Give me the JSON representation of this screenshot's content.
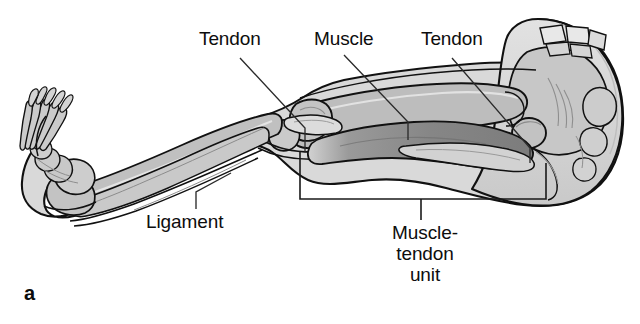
{
  "figure": {
    "panel_letter": "a",
    "background_color": "#ffffff",
    "outline_color": "#111111"
  },
  "palette": {
    "soft_tissue_light": "#d9d9d9",
    "soft_tissue_mid": "#c6c6c6",
    "bone_gray": "#b5b5b5",
    "bone_light": "#cfcfcf",
    "muscle_dark": "#8a8a8a",
    "muscle_darker": "#7b7b7b",
    "outline": "#111111",
    "leader_line": "#2b2b2b",
    "bracket": "#1a1a1a",
    "text": "#0d0d0d"
  },
  "labels": {
    "tendon_proximal": "Tendon",
    "muscle": "Muscle",
    "tendon_distal": "Tendon",
    "ligament": "Ligament",
    "muscle_tendon_unit_line1": "Muscle-",
    "muscle_tendon_unit_line2": "tendon",
    "muscle_tendon_unit_line3": "unit"
  },
  "annotations": {
    "leader_tendon_proximal": {
      "from": [
        240,
        58
      ],
      "bend": [
        305,
        128
      ],
      "to": [
        305,
        152
      ]
    },
    "leader_muscle": {
      "from": [
        344,
        55
      ],
      "bend": [
        408,
        122
      ],
      "to": [
        408,
        140
      ]
    },
    "leader_tendon_distal": {
      "from": [
        452,
        58
      ],
      "bend": [
        530,
        148
      ],
      "to": [
        530,
        163
      ]
    },
    "leader_ligament": {
      "from": [
        231,
        173
      ],
      "bend": [
        196,
        192
      ],
      "to": [
        196,
        209
      ]
    },
    "bracket_muscle_tendon_unit": {
      "left_x": 300,
      "right_x": 546,
      "top_y": 152,
      "bottom_y": 199,
      "stem_x": 421,
      "stem_bottom_y": 220
    }
  },
  "anatomy_parts": [
    {
      "name": "foot",
      "description": "foot with tarsals, metatarsals and phalanges"
    },
    {
      "name": "calcaneus",
      "description": "heel bone"
    },
    {
      "name": "tibia",
      "description": "shin bone of lower leg"
    },
    {
      "name": "fibula",
      "description": "lateral bone of lower leg"
    },
    {
      "name": "patella",
      "description": "kneecap at the knee joint"
    },
    {
      "name": "femur",
      "description": "thigh bone"
    },
    {
      "name": "femoral-head",
      "description": "ball of femur in hip socket"
    },
    {
      "name": "ilium",
      "description": "large flat pelvic bone"
    },
    {
      "name": "sacrum",
      "description": "sacral vertebrae at top of pelvis"
    },
    {
      "name": "coccyx",
      "description": "tailbone"
    },
    {
      "name": "hamstring-muscle",
      "description": "dark posterior thigh muscle belly"
    },
    {
      "name": "achilles-tendon",
      "description": "tendon at back of lower leg"
    }
  ]
}
